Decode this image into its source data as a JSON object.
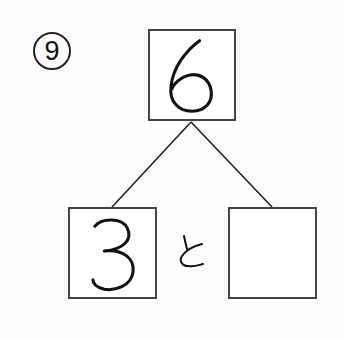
{
  "problem": {
    "number_label": "9",
    "number_display": "⑨"
  },
  "number_bond": {
    "whole": "6",
    "part_left": "3",
    "connector_word": "と",
    "part_right": ""
  },
  "colors": {
    "ink": "#111111",
    "box_border": "#444444",
    "background": "#fdfdfd"
  }
}
